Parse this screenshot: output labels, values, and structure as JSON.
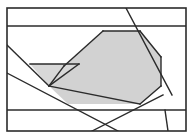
{
  "figure": {
    "kind": "line-drawing",
    "title": "",
    "canvas": {
      "width": 193,
      "height": 139,
      "background": "#ffffff"
    },
    "style": {
      "stroke_color": "#2b2b2b",
      "stroke_width": 1.4,
      "border_color": "#2b2b2b",
      "border_width": 1.6,
      "fill_gray": "#d2d2d2",
      "fill_gray_light": "#d8d8d8"
    },
    "frame": {
      "x": 7,
      "y": 8,
      "width": 179,
      "height": 123
    },
    "shaded_regions": [
      {
        "name": "large-shaded-polygon",
        "fill": "#d2d2d2",
        "points": "103,31 140,31 161,57 161,86 140,104 68,104 49,86 64,66"
      },
      {
        "name": "small-shaded-triangle",
        "fill": "#d8d8d8",
        "points": "30,64 79,64 49,86"
      }
    ],
    "segments": [
      {
        "name": "horizontal-line-upper",
        "x1": 7,
        "y1": 26,
        "x2": 186,
        "y2": 26
      },
      {
        "name": "horizontal-line-lower",
        "x1": 7,
        "y1": 110,
        "x2": 186,
        "y2": 110
      },
      {
        "name": "diagonal-top-to-right",
        "x1": 126,
        "y1": 8,
        "x2": 172,
        "y2": 95
      },
      {
        "name": "diagonal-left-upper",
        "x1": 7,
        "y1": 45,
        "x2": 49,
        "y2": 86
      },
      {
        "name": "diagonal-left-lower",
        "x1": 7,
        "y1": 73,
        "x2": 118,
        "y2": 131
      },
      {
        "name": "diagonal-bottom-to-right",
        "x1": 92,
        "y1": 131,
        "x2": 163,
        "y2": 95
      },
      {
        "name": "vertical-right-short",
        "x1": 165,
        "y1": 110,
        "x2": 168,
        "y2": 131
      },
      {
        "name": "polygon-edge-top",
        "x1": 103,
        "y1": 31,
        "x2": 140,
        "y2": 31
      },
      {
        "name": "polygon-edge-upper-right",
        "x1": 140,
        "y1": 31,
        "x2": 161,
        "y2": 57
      },
      {
        "name": "polygon-edge-right",
        "x1": 161,
        "y1": 57,
        "x2": 161,
        "y2": 86
      },
      {
        "name": "polygon-edge-lower-right",
        "x1": 161,
        "y1": 86,
        "x2": 140,
        "y2": 104
      },
      {
        "name": "polygon-edge-bottom",
        "x1": 140,
        "y1": 104,
        "x2": 49,
        "y2": 86
      },
      {
        "name": "polygon-edge-lower-left",
        "x1": 49,
        "y1": 86,
        "x2": 64,
        "y2": 66
      },
      {
        "name": "polygon-edge-upper-left",
        "x1": 64,
        "y1": 66,
        "x2": 103,
        "y2": 31
      },
      {
        "name": "triangle-edge-top",
        "x1": 30,
        "y1": 64,
        "x2": 79,
        "y2": 64
      },
      {
        "name": "triangle-edge-right",
        "x1": 79,
        "y1": 64,
        "x2": 49,
        "y2": 86
      }
    ]
  }
}
